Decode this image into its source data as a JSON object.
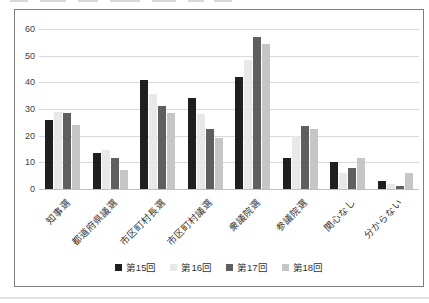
{
  "chart_data": {
    "type": "bar",
    "title": "",
    "xlabel": "",
    "ylabel": "",
    "categories": [
      "知事選",
      "都道府県議選",
      "市区町村長選",
      "市区町村議選",
      "衆議院選",
      "参議院選",
      "関心なし",
      "分からない"
    ],
    "series": [
      {
        "name": "第15回",
        "color": "#1f1f1f",
        "values": [
          26,
          13.5,
          41,
          34,
          42,
          11.5,
          10,
          3
        ]
      },
      {
        "name": "第16回",
        "color": "#e8e8e8",
        "values": [
          29,
          14.5,
          35.5,
          28,
          48.5,
          20,
          6,
          2
        ]
      },
      {
        "name": "第17回",
        "color": "#5f5f5f",
        "values": [
          28.5,
          11.5,
          31,
          22.5,
          57,
          23.5,
          8,
          1
        ]
      },
      {
        "name": "第18回",
        "color": "#c6c6c6",
        "values": [
          24,
          7,
          28.5,
          19,
          54.5,
          22.5,
          11.5,
          6
        ]
      }
    ],
    "ylim": [
      0,
      60
    ],
    "ytick_step": 10,
    "ytick_labels": [
      "0",
      "10",
      "20",
      "30",
      "40",
      "50",
      "60"
    ],
    "grid": "horizontal",
    "legend_position": "bottom",
    "colors": {
      "gridline": "#d9d9d9",
      "frame_border": "#808080",
      "text": "#404040",
      "background": "#ffffff"
    }
  }
}
